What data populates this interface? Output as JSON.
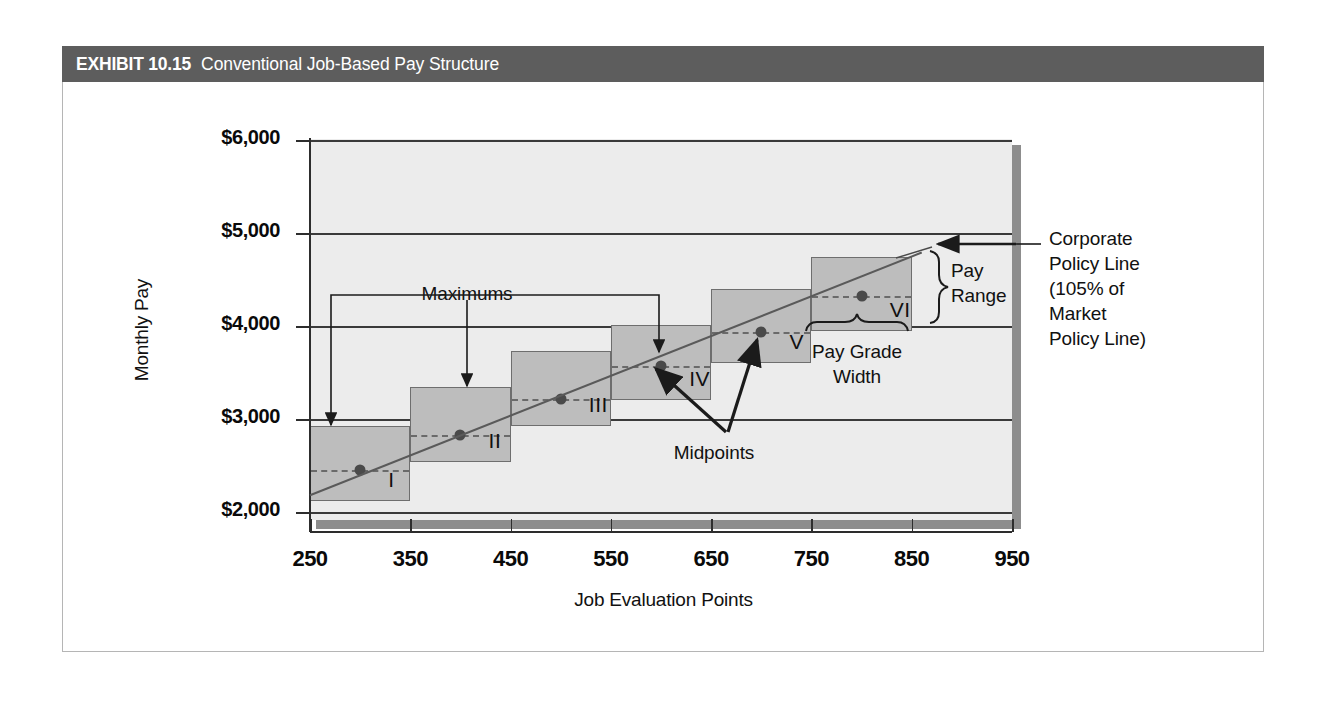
{
  "exhibit": {
    "label": "EXHIBIT 10.15",
    "title": "Conventional Job-Based Pay Structure",
    "header_bg": "#5d5d5d"
  },
  "chart_data": {
    "type": "bar",
    "title": "Conventional Job-Based Pay Structure",
    "xlabel": "Job Evaluation Points",
    "ylabel": "Monthly Pay",
    "xlim": [
      250,
      950
    ],
    "ylim": [
      2000,
      6000
    ],
    "xticks": [
      250,
      350,
      450,
      550,
      650,
      750,
      850,
      950
    ],
    "xtick_labels": [
      "250",
      "350",
      "450",
      "550",
      "650",
      "750",
      "850",
      "950"
    ],
    "yticks": [
      2000,
      3000,
      4000,
      5000,
      6000
    ],
    "ytick_labels": [
      "$2,000",
      "$3,000",
      "$4,000",
      "$5,000",
      "$6,000"
    ],
    "grid": true,
    "legend": "none",
    "plot_bg": "#ececec",
    "box_fill": "#bdbdbd",
    "box_stroke": "#6e6e6e",
    "grades": [
      {
        "name": "I",
        "x_min": 250,
        "x_max": 350,
        "pay_min": 2120,
        "pay_max": 2930,
        "midpoint": 2450,
        "mid_x": 300
      },
      {
        "name": "II",
        "x_min": 350,
        "x_max": 450,
        "pay_min": 2540,
        "pay_max": 3340,
        "midpoint": 2830,
        "mid_x": 400
      },
      {
        "name": "III",
        "x_min": 450,
        "x_max": 550,
        "pay_min": 2930,
        "pay_max": 3730,
        "midpoint": 3210,
        "mid_x": 500
      },
      {
        "name": "IV",
        "x_min": 550,
        "x_max": 650,
        "pay_min": 3200,
        "pay_max": 4010,
        "midpoint": 3570,
        "mid_x": 600
      },
      {
        "name": "V",
        "x_min": 650,
        "x_max": 750,
        "pay_min": 3600,
        "pay_max": 4400,
        "midpoint": 3940,
        "mid_x": 700
      },
      {
        "name": "VI",
        "x_min": 750,
        "x_max": 850,
        "pay_min": 3950,
        "pay_max": 4740,
        "midpoint": 4320,
        "mid_x": 800
      }
    ],
    "policy_line": {
      "x_start": 250,
      "y_start": 2180,
      "x_end": 860,
      "y_end": 4790
    },
    "annotations": {
      "maximums": "Maximums",
      "midpoints": "Midpoints",
      "pay_range": "Pay\nRange",
      "pay_range_line1": "Pay",
      "pay_range_line2": "Range",
      "pay_grade_width_line1": "Pay Grade",
      "pay_grade_width_line2": "Width",
      "corporate_policy_line": [
        "Corporate",
        "Policy Line",
        "(105% of",
        "Market",
        "Policy Line)"
      ]
    }
  }
}
